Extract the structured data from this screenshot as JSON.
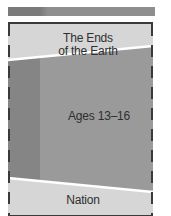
{
  "diagram": {
    "top_bar": {
      "color_left": "#7a7a7a",
      "color_right": "#8e8e8e"
    },
    "bands": [
      {
        "name": "ends-of-earth",
        "label_line1": "The Ends",
        "label_line2": "of the Earth",
        "color": "#d6d6d6"
      },
      {
        "name": "ages",
        "label": "Ages 13–16",
        "color": "#9a9a9a",
        "left_strip_color": "#858585"
      },
      {
        "name": "nation",
        "label": "Nation",
        "color": "#d6d6d6"
      }
    ],
    "divider_color": "#ffffff",
    "border_color": "#3a3a3a"
  }
}
